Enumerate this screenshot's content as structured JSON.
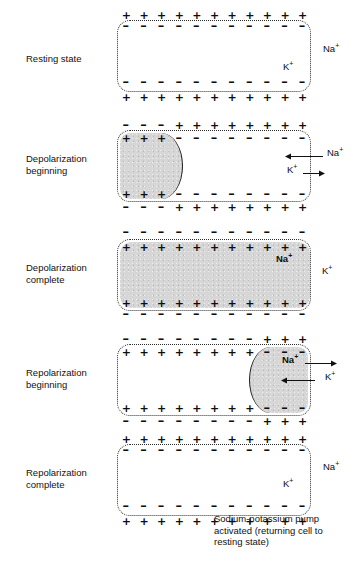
{
  "figure": {
    "caption": "Sodium-potassium pump\nactivated (returning cell to\nresting state)",
    "caption_x": 214,
    "caption_y": 513
  },
  "geometry": {
    "cell_left": 117,
    "cell_width": 194,
    "cell_height": 72
  },
  "panels": [
    {
      "id": "resting-state",
      "label": "Resting state",
      "label_y": 53,
      "cell_top": 20,
      "outer_top_charges": [
        "+",
        "+",
        "+",
        "+",
        "+",
        "+",
        "+",
        "+",
        "+",
        "+",
        "+"
      ],
      "inner_top_charges": [
        "-",
        "-",
        "-",
        "-",
        "-",
        "-",
        "-",
        "-",
        "-",
        "-",
        "-"
      ],
      "inner_bottom_charges": [
        "-",
        "-",
        "-",
        "-",
        "-",
        "-",
        "-",
        "-",
        "-",
        "-",
        "-"
      ],
      "outer_bottom_charges": [
        "+",
        "+",
        "+",
        "+",
        "+",
        "+",
        "+",
        "+",
        "+",
        "+",
        "+"
      ],
      "shade": null,
      "ions": [
        {
          "name": "Na",
          "charge": "+",
          "x": 323,
          "y": 44,
          "bold": false
        },
        {
          "name": "K",
          "charge": "+",
          "x": 283,
          "y": 62,
          "bold": false
        }
      ],
      "arrows": []
    },
    {
      "id": "depolarization-beginning",
      "label": "Depolarization\nbeginning",
      "label_y": 153,
      "cell_top": 130,
      "outer_top_charges": [
        "-",
        "-",
        "-",
        "+",
        "+",
        "+",
        "+",
        "+",
        "+",
        "+",
        "+"
      ],
      "inner_top_charges": [
        "+",
        "+",
        "+",
        "-",
        "-",
        "-",
        "-",
        "-",
        "-",
        "-",
        "-"
      ],
      "inner_bottom_charges": [
        "+",
        "+",
        "+",
        "-",
        "-",
        "-",
        "-",
        "-",
        "-",
        "-",
        "-"
      ],
      "outer_bottom_charges": [
        "-",
        "-",
        "-",
        "+",
        "+",
        "+",
        "+",
        "+",
        "+",
        "+",
        "+"
      ],
      "shade": {
        "side": "left",
        "offset": 2,
        "span": 62
      },
      "ions": [
        {
          "name": "Na",
          "charge": "+",
          "x": 327,
          "y": 148,
          "bold": false
        },
        {
          "name": "K",
          "charge": "+",
          "x": 287,
          "y": 165,
          "bold": false
        }
      ],
      "arrows": [
        {
          "dir": "left",
          "x": 285,
          "y": 152,
          "len": 38,
          "label": "Na-influx"
        },
        {
          "dir": "right",
          "x": 303,
          "y": 169,
          "len": 22,
          "label": "K-efflux"
        }
      ]
    },
    {
      "id": "depolarization-complete",
      "label": "Depolarization\ncomplete",
      "label_y": 262,
      "cell_top": 239,
      "outer_top_charges": [
        "-",
        "-",
        "-",
        "-",
        "-",
        "-",
        "-",
        "-",
        "-",
        "-",
        "-"
      ],
      "inner_top_charges": [
        "+",
        "+",
        "+",
        "+",
        "+",
        "+",
        "+",
        "+",
        "+",
        "+",
        "+"
      ],
      "inner_bottom_charges": [
        "+",
        "+",
        "+",
        "+",
        "+",
        "+",
        "+",
        "+",
        "+",
        "+",
        "+"
      ],
      "outer_bottom_charges": [
        "-",
        "-",
        "-",
        "-",
        "-",
        "-",
        "-",
        "-",
        "-",
        "-",
        "-"
      ],
      "shade": {
        "side": "full",
        "offset": 2,
        "span": 190
      },
      "ions": [
        {
          "name": "Na",
          "charge": "+",
          "x": 276,
          "y": 254,
          "bold": true
        },
        {
          "name": "K",
          "charge": "+",
          "x": 322,
          "y": 266,
          "bold": false
        }
      ],
      "arrows": []
    },
    {
      "id": "repolarization-beginning",
      "label": "Repolarization\nbeginning",
      "label_y": 367,
      "cell_top": 344,
      "outer_top_charges": [
        "-",
        "-",
        "-",
        "-",
        "-",
        "-",
        "-",
        "-",
        "+",
        "+",
        "+"
      ],
      "inner_top_charges": [
        "+",
        "+",
        "+",
        "+",
        "+",
        "+",
        "+",
        "+",
        "-",
        "-",
        "-"
      ],
      "inner_bottom_charges": [
        "+",
        "+",
        "+",
        "+",
        "+",
        "+",
        "+",
        "+",
        "-",
        "-",
        "-"
      ],
      "outer_bottom_charges": [
        "-",
        "-",
        "-",
        "-",
        "-",
        "-",
        "-",
        "-",
        "+",
        "+",
        "+"
      ],
      "shade": {
        "side": "right",
        "offset": 2,
        "span": 58
      },
      "ions": [
        {
          "name": "Na",
          "charge": "+",
          "x": 282,
          "y": 355,
          "bold": true
        },
        {
          "name": "K",
          "charge": "+",
          "x": 325,
          "y": 372,
          "bold": false
        }
      ],
      "arrows": [
        {
          "dir": "right",
          "x": 305,
          "y": 359,
          "len": 32,
          "label": "Na-efflux"
        },
        {
          "dir": "left",
          "x": 281,
          "y": 376,
          "len": 34,
          "label": "K-influx"
        }
      ]
    },
    {
      "id": "repolarization-complete",
      "label": "Repolarization\ncomplete",
      "label_y": 467,
      "cell_top": 444,
      "outer_top_charges": [
        "+",
        "+",
        "+",
        "+",
        "+",
        "+",
        "+",
        "+",
        "+",
        "+",
        "+"
      ],
      "inner_top_charges": [
        "-",
        "-",
        "-",
        "-",
        "-",
        "-",
        "-",
        "-",
        "-",
        "-",
        "-"
      ],
      "inner_bottom_charges": [
        "-",
        "-",
        "-",
        "-",
        "-",
        "-",
        "-",
        "-",
        "-",
        "-",
        "-"
      ],
      "outer_bottom_charges": [
        "+",
        "+",
        "+",
        "+",
        "+",
        "+",
        "+",
        "+",
        "+",
        "+",
        "+"
      ],
      "shade": null,
      "ions": [
        {
          "name": "Na",
          "charge": "+",
          "x": 323,
          "y": 462,
          "bold": false
        },
        {
          "name": "K",
          "charge": "+",
          "x": 283,
          "y": 479,
          "bold": false
        }
      ],
      "arrows": []
    }
  ]
}
